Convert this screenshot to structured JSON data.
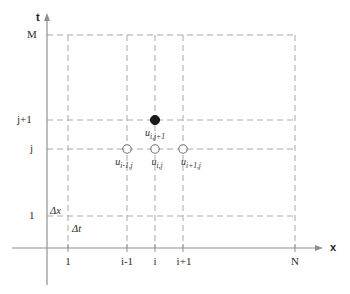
{
  "figure": {
    "type": "finite-difference-stencil-diagram",
    "background_color": "#ffffff",
    "axes": {
      "vertical": {
        "name": "t-axis",
        "label": "t",
        "arrow": "up"
      },
      "horizontal": {
        "name": "x-axis",
        "label": "x",
        "arrow": "right"
      }
    },
    "axis_color": "#8f8f8f",
    "grid_color": "#a9a9a9",
    "grid_style": "dashed",
    "marker_color": "#1a1a1a"
  },
  "y_ticks": [
    {
      "label": "M",
      "y": 35
    },
    {
      "label": "j+1",
      "y": 120
    },
    {
      "label": "j",
      "y": 149
    },
    {
      "label": "1",
      "y": 216
    }
  ],
  "x_ticks": [
    {
      "label": "1",
      "x": 68
    },
    {
      "label": "i-1",
      "x": 127
    },
    {
      "label": "i",
      "x": 155
    },
    {
      "label": "i+1",
      "x": 183
    },
    {
      "label": "N",
      "x": 295
    }
  ],
  "step_labels": [
    {
      "name": "delta-x-label",
      "text": "Δx",
      "x": 50,
      "y": 206
    },
    {
      "name": "delta-t-label",
      "text": "Δt",
      "x": 72,
      "y": 224
    }
  ],
  "nodes": [
    {
      "name": "node-i-jplus1",
      "marker": "filled-circle",
      "x": 155,
      "y": 120,
      "base": "u",
      "subscript": "i,j+1",
      "label_x": 155,
      "label_y": 128
    },
    {
      "name": "node-iminus1-j",
      "marker": "open-circle",
      "x": 127,
      "y": 149,
      "base": "u",
      "subscript": "i-1,j",
      "label_x": 124,
      "label_y": 157
    },
    {
      "name": "node-i-j",
      "marker": "open-circle",
      "x": 155,
      "y": 149,
      "base": "u",
      "subscript": "i,j",
      "label_x": 156,
      "label_y": 157
    },
    {
      "name": "node-iplus1-j",
      "marker": "open-circle",
      "x": 183,
      "y": 149,
      "base": "u",
      "subscript": "i+1,j",
      "label_x": 190,
      "label_y": 157
    }
  ]
}
